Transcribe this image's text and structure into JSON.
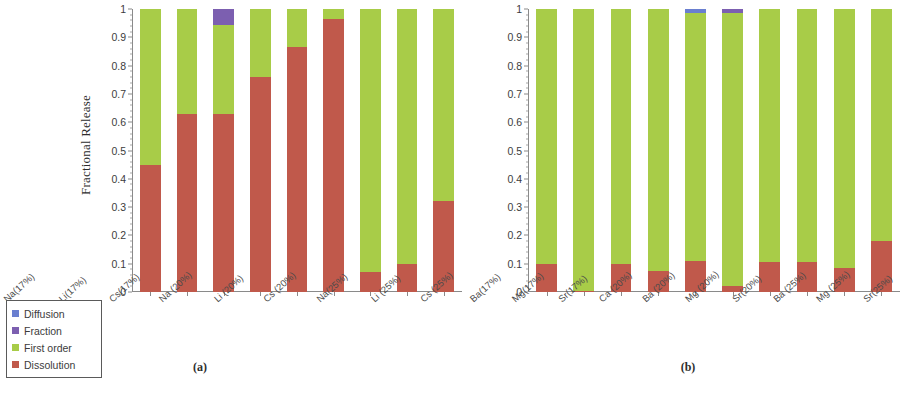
{
  "legend": {
    "name": "series-legend",
    "items": [
      {
        "label": "Diffusion",
        "color": "#6a7fd0"
      },
      {
        "label": "Fraction",
        "color": "#7c5fb0"
      },
      {
        "label": "First order",
        "color": "#a8cc48"
      },
      {
        "label": "Dissolution",
        "color": "#c0594b"
      }
    ]
  },
  "axis": {
    "ylabel": "Fractional Release",
    "yticks": [
      "0",
      "0.1",
      "0.2",
      "0.3",
      "0.4",
      "0.5",
      "0.6",
      "0.7",
      "0.8",
      "0.9",
      "1"
    ]
  },
  "panels": [
    {
      "caption": "(a)"
    },
    {
      "caption": "(b)"
    }
  ],
  "chart_data": [
    {
      "type": "bar",
      "subtype": "stacked-100",
      "title": "(a)",
      "xlabel": "",
      "ylabel": "Fractional Release",
      "ylim": [
        0,
        1
      ],
      "ytick_step": 0.1,
      "grid": false,
      "legend_position": "outside-left-bottom",
      "categories": [
        "Na(17%)",
        "Li(17%)",
        "Cs(17%)",
        "Na (20%)",
        "Li (20%)",
        "Cs (20%)",
        "Na(25%)",
        "Li (25%)",
        "Cs (25%)"
      ],
      "series": [
        {
          "name": "Dissolution",
          "color": "#c0594b",
          "values": [
            0.45,
            0.63,
            0.63,
            0.76,
            0.865,
            0.965,
            0.07,
            0.1,
            0.32
          ]
        },
        {
          "name": "First order",
          "color": "#a8cc48",
          "values": [
            0.55,
            0.37,
            0.315,
            0.24,
            0.135,
            0.035,
            0.93,
            0.9,
            0.68
          ]
        },
        {
          "name": "Fraction",
          "color": "#7c5fb0",
          "values": [
            0.0,
            0.0,
            0.055,
            0.0,
            0.0,
            0.0,
            0.0,
            0.0,
            0.0
          ]
        },
        {
          "name": "Diffusion",
          "color": "#6a7fd0",
          "values": [
            0.0,
            0.0,
            0.0,
            0.0,
            0.0,
            0.0,
            0.0,
            0.0,
            0.0
          ]
        }
      ]
    },
    {
      "type": "bar",
      "subtype": "stacked-100",
      "title": "(b)",
      "xlabel": "",
      "ylabel": "Fractional Release",
      "ylim": [
        0,
        1
      ],
      "ytick_step": 0.1,
      "grid": false,
      "legend_position": "outside-left-bottom",
      "categories": [
        "Ba(17%)",
        "Mg(17%)",
        "Sr(17%)",
        "Ca (20%)",
        "Ba (20%)",
        "Mg (20%)",
        "Sr(20%)",
        "Ba (25%)",
        "Mg (25%)",
        "Sr(25%)"
      ],
      "series": [
        {
          "name": "Dissolution",
          "color": "#c0594b",
          "values": [
            0.1,
            0.005,
            0.1,
            0.075,
            0.11,
            0.02,
            0.105,
            0.105,
            0.085,
            0.18
          ]
        },
        {
          "name": "First order",
          "color": "#a8cc48",
          "values": [
            0.9,
            0.995,
            0.9,
            0.925,
            0.875,
            0.965,
            0.895,
            0.895,
            0.915,
            0.82
          ]
        },
        {
          "name": "Fraction",
          "color": "#7c5fb0",
          "values": [
            0.0,
            0.0,
            0.0,
            0.0,
            0.0,
            0.015,
            0.0,
            0.0,
            0.0,
            0.0
          ]
        },
        {
          "name": "Diffusion",
          "color": "#6a7fd0",
          "values": [
            0.0,
            0.0,
            0.0,
            0.0,
            0.015,
            0.0,
            0.0,
            0.0,
            0.0,
            0.0
          ]
        }
      ]
    }
  ]
}
